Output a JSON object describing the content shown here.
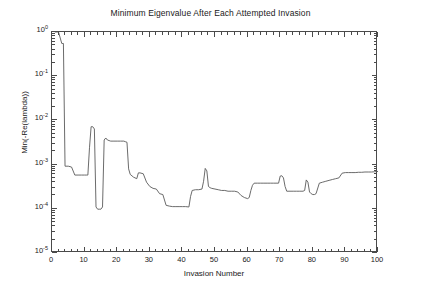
{
  "chart_data": {
    "type": "line",
    "title": "Minimum Eigenvalue After Each Attempted Invasion",
    "xlabel": "Invasion Number",
    "ylabel": "Min(-Re(lambda))",
    "xscale": "linear",
    "yscale": "log",
    "xlim": [
      0,
      100
    ],
    "ylim": [
      1e-05,
      1
    ],
    "grid": false,
    "legend": null,
    "line_color": "#5a5a5a",
    "xticks": [
      0,
      10,
      20,
      30,
      40,
      50,
      60,
      70,
      80,
      90,
      100
    ],
    "xtick_labels": [
      "0",
      "10",
      "20",
      "30",
      "40",
      "50",
      "60",
      "70",
      "80",
      "90",
      "100"
    ],
    "yticks": [
      1e-05,
      0.0001,
      0.001,
      0.01,
      0.1,
      1
    ],
    "ytick_labels": [
      "10-5",
      "10-4",
      "10-3",
      "10-2",
      "10-1",
      "100"
    ],
    "ytick_mantissas": [
      "10",
      "10",
      "10",
      "10",
      "10",
      "10"
    ],
    "ytick_exponents": [
      "-5",
      "-4",
      "-3",
      "-2",
      "-1",
      "0"
    ],
    "series": [
      {
        "name": "Min(-Re(lambda))",
        "x": [
          1,
          2,
          3,
          3.5,
          4,
          5,
          6,
          7,
          8,
          9,
          10,
          10.5,
          11,
          11.5,
          12,
          12.5,
          13,
          13.5,
          14,
          14.5,
          15,
          15.5,
          16,
          16.5,
          17,
          18,
          19,
          20,
          21,
          22,
          22.5,
          23,
          23.5,
          24,
          25,
          26,
          26.5,
          27,
          28,
          29,
          30,
          31,
          32,
          33,
          34,
          35,
          36,
          37,
          38,
          39,
          40,
          41,
          42,
          42.5,
          43,
          44,
          45,
          46,
          46.5,
          47,
          47.5,
          48,
          48.5,
          49,
          50,
          51,
          52,
          53,
          54,
          55,
          56,
          57,
          58,
          59,
          60,
          60.5,
          61,
          61.5,
          62,
          63,
          64,
          65,
          66,
          67,
          68,
          69,
          69.5,
          70,
          70.5,
          71,
          71.5,
          72,
          73,
          74,
          75,
          76,
          77,
          77.5,
          78,
          78.5,
          79,
          79.5,
          80,
          80.5,
          81,
          82,
          83,
          84,
          85,
          86,
          87,
          88,
          89,
          90,
          91,
          92,
          93,
          94,
          95,
          96,
          97,
          98,
          99,
          100
        ],
        "y": [
          1.0,
          1.0,
          0.55,
          0.55,
          0.00092,
          0.00092,
          0.00088,
          0.00058,
          0.00058,
          0.00058,
          0.00058,
          0.00058,
          0.00058,
          0.0024,
          0.0072,
          0.0072,
          0.0064,
          0.00011,
          9.8e-05,
          9.8e-05,
          9.8e-05,
          0.00011,
          0.0036,
          0.004,
          0.0036,
          0.0034,
          0.0034,
          0.0034,
          0.0034,
          0.0034,
          0.0033,
          0.0032,
          0.0008,
          0.0006,
          0.00052,
          0.00048,
          0.00065,
          0.00065,
          0.00062,
          0.0004,
          0.00032,
          0.00029,
          0.00028,
          0.00022,
          0.00021,
          0.00012,
          0.000115,
          0.000112,
          0.000112,
          0.000112,
          0.000112,
          0.000112,
          0.00011,
          0.00019,
          0.00026,
          0.00027,
          0.00027,
          0.00028,
          0.00042,
          0.00082,
          0.00072,
          0.00032,
          0.0003,
          0.00029,
          0.00028,
          0.00027,
          0.00026,
          0.00026,
          0.00025,
          0.00025,
          0.00025,
          0.00024,
          0.0002,
          0.00018,
          0.00017,
          0.00018,
          0.00026,
          0.00034,
          0.00038,
          0.00038,
          0.00038,
          0.00038,
          0.00038,
          0.00038,
          0.00038,
          0.00038,
          0.00038,
          0.00055,
          0.00056,
          0.0005,
          0.00032,
          0.00025,
          0.00025,
          0.00025,
          0.00025,
          0.00025,
          0.00025,
          0.00026,
          0.00045,
          0.0004,
          0.00024,
          0.00022,
          0.00021,
          0.00021,
          0.00022,
          0.00038,
          0.0004,
          0.00042,
          0.00044,
          0.00046,
          0.00048,
          0.0005,
          0.00064,
          0.00066,
          0.00066,
          0.00066,
          0.00066,
          0.00067,
          0.00067,
          0.00068,
          0.00068,
          0.00068,
          0.00069,
          0.0007
        ]
      }
    ]
  }
}
